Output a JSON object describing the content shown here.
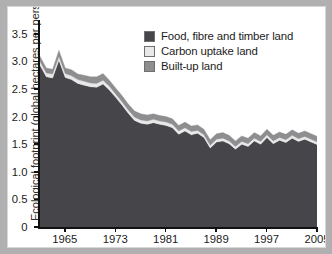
{
  "figure": {
    "ylabel": "Ecological footprint (global hectares per person)",
    "xlabel": ""
  },
  "legend": {
    "position": "top-right",
    "items": [
      {
        "label": "Food, fibre and timber land",
        "color": "#46464a",
        "swatch": "legend-swatch-food"
      },
      {
        "label": "Carbon uptake land",
        "color": "#e8e8e8",
        "swatch": "legend-swatch-carbon"
      },
      {
        "label": "Built-up land",
        "color": "#8e8e90",
        "swatch": "legend-swatch-builtup"
      }
    ]
  },
  "axes": {
    "y_ticks": [
      "0",
      "0.5",
      "1.0",
      "1.5",
      "2.0",
      "2.5",
      "3.0",
      "3.5"
    ],
    "y_values": [
      0,
      0.5,
      1.0,
      1.5,
      2.0,
      2.5,
      3.0,
      3.5
    ],
    "x_ticks": [
      "1965",
      "1973",
      "1981",
      "1989",
      "1997",
      "2005"
    ],
    "x_values": [
      1965,
      1973,
      1981,
      1989,
      1997,
      2005
    ]
  },
  "chart_data": {
    "type": "area",
    "stacked": true,
    "title": "",
    "xlabel": "",
    "ylabel": "Ecological footprint (global hectares per person)",
    "xlim": [
      1961,
      2005
    ],
    "ylim": [
      0,
      3.75
    ],
    "grid": false,
    "legend_position": "top-right",
    "x": [
      1961,
      1962,
      1963,
      1964,
      1965,
      1966,
      1967,
      1968,
      1969,
      1970,
      1971,
      1972,
      1973,
      1974,
      1975,
      1976,
      1977,
      1978,
      1979,
      1980,
      1981,
      1982,
      1983,
      1984,
      1985,
      1986,
      1987,
      1988,
      1989,
      1990,
      1991,
      1992,
      1993,
      1994,
      1995,
      1996,
      1997,
      1998,
      1999,
      2000,
      2001,
      2002,
      2003,
      2004,
      2005
    ],
    "series": [
      {
        "name": "Food, fibre and timber land",
        "color": "#46464a",
        "values": [
          2.93,
          2.72,
          2.7,
          3.02,
          2.71,
          2.67,
          2.6,
          2.57,
          2.54,
          2.53,
          2.59,
          2.48,
          2.35,
          2.21,
          2.06,
          1.93,
          1.88,
          1.86,
          1.89,
          1.86,
          1.84,
          1.8,
          1.68,
          1.74,
          1.67,
          1.7,
          1.62,
          1.43,
          1.54,
          1.56,
          1.51,
          1.41,
          1.5,
          1.46,
          1.56,
          1.5,
          1.62,
          1.51,
          1.57,
          1.53,
          1.61,
          1.55,
          1.59,
          1.54,
          1.49
        ]
      },
      {
        "name": "Carbon uptake land",
        "color": "#e8e8e8",
        "values": [
          0.07,
          0.07,
          0.07,
          0.07,
          0.07,
          0.07,
          0.07,
          0.07,
          0.07,
          0.07,
          0.07,
          0.07,
          0.06,
          0.06,
          0.06,
          0.06,
          0.06,
          0.06,
          0.06,
          0.06,
          0.06,
          0.06,
          0.06,
          0.06,
          0.06,
          0.05,
          0.05,
          0.05,
          0.05,
          0.05,
          0.05,
          0.05,
          0.05,
          0.05,
          0.05,
          0.05,
          0.05,
          0.05,
          0.05,
          0.05,
          0.05,
          0.05,
          0.05,
          0.05,
          0.05
        ]
      },
      {
        "name": "Built-up land",
        "color": "#8e8e90",
        "values": [
          0.09,
          0.09,
          0.09,
          0.11,
          0.1,
          0.11,
          0.1,
          0.11,
          0.11,
          0.12,
          0.12,
          0.11,
          0.11,
          0.11,
          0.11,
          0.11,
          0.11,
          0.11,
          0.1,
          0.1,
          0.1,
          0.1,
          0.1,
          0.1,
          0.1,
          0.1,
          0.1,
          0.1,
          0.1,
          0.1,
          0.1,
          0.1,
          0.1,
          0.1,
          0.1,
          0.1,
          0.1,
          0.1,
          0.1,
          0.1,
          0.1,
          0.1,
          0.1,
          0.1,
          0.1
        ]
      }
    ],
    "totals": [
      3.09,
      2.88,
      2.86,
      3.2,
      2.88,
      2.85,
      2.77,
      2.75,
      2.72,
      2.72,
      2.78,
      2.66,
      2.52,
      2.38,
      2.23,
      2.1,
      2.05,
      2.03,
      2.05,
      2.02,
      2.0,
      1.96,
      1.84,
      1.9,
      1.83,
      1.85,
      1.77,
      1.58,
      1.69,
      1.71,
      1.66,
      1.56,
      1.65,
      1.61,
      1.71,
      1.65,
      1.77,
      1.66,
      1.72,
      1.68,
      1.76,
      1.7,
      1.74,
      1.69,
      1.64
    ]
  }
}
